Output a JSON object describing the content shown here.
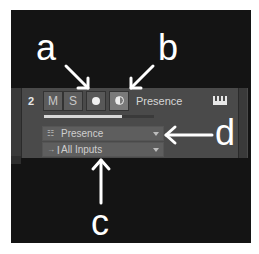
{
  "callouts": {
    "a": "a",
    "b": "b",
    "c": "c",
    "d": "d"
  },
  "track": {
    "number": "2",
    "mute_label": "M",
    "solo_label": "S",
    "record_icon": "record-dot-icon",
    "monitor_icon": "monitor-icon",
    "name": "Presence",
    "instrument_icon": "keyboard-icon",
    "meter_level_percent": 71,
    "instrument_dropdown": {
      "icon": "keyboard-icon",
      "value": "Presence"
    },
    "input_dropdown": {
      "icon": "input-arrow-icon",
      "value": "All Inputs"
    }
  },
  "colors": {
    "frame_bg": "#141414",
    "track_bg": "#4a4a4a",
    "button_bg": "#5c5c5c",
    "monitor_active_bg": "#7a7a7a",
    "callout_text": "#ffffff"
  }
}
